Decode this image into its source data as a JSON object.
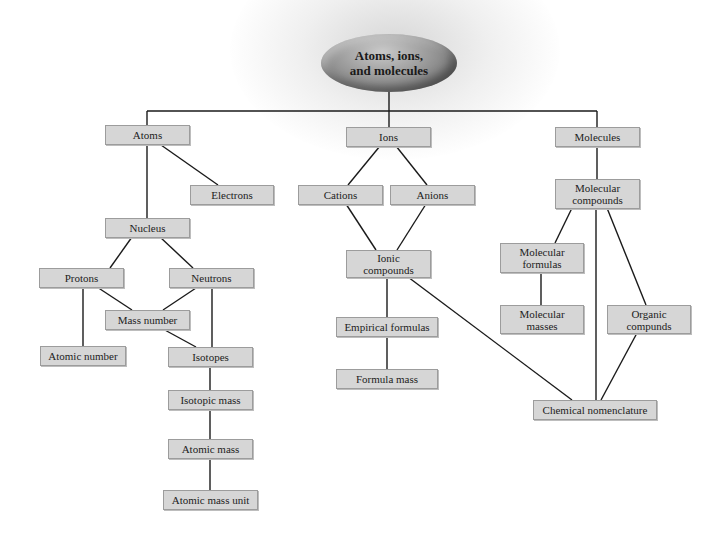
{
  "diagram": {
    "type": "concept-map",
    "root": {
      "label": "Atoms, ions,\nand molecules"
    },
    "branches": {
      "atoms": {
        "atoms": "Atoms",
        "electrons": "Electrons",
        "nucleus": "Nucleus",
        "protons": "Protons",
        "neutrons": "Neutrons",
        "mass_number": "Mass number",
        "atomic_number": "Atomic number",
        "isotopes": "Isotopes",
        "isotopic_mass": "Isotopic mass",
        "atomic_mass": "Atomic mass",
        "atomic_mass_unit": "Atomic mass unit"
      },
      "ions": {
        "ions": "Ions",
        "cations": "Cations",
        "anions": "Anions",
        "ionic_compounds": "Ionic\ncompounds",
        "empirical_formulas": "Empirical formulas",
        "formula_mass": "Formula mass"
      },
      "molecules": {
        "molecules": "Molecules",
        "molecular_compounds": "Molecular\ncompounds",
        "molecular_formulas": "Molecular\nformulas",
        "molecular_masses": "Molecular\nmasses",
        "organic_compounds": "Organic\ncompunds",
        "chemical_nomenclature": "Chemical nomenclature"
      }
    },
    "edges": [
      [
        "root",
        "atoms"
      ],
      [
        "root",
        "ions"
      ],
      [
        "root",
        "molecules"
      ],
      [
        "atoms",
        "electrons"
      ],
      [
        "atoms",
        "nucleus"
      ],
      [
        "nucleus",
        "protons"
      ],
      [
        "nucleus",
        "neutrons"
      ],
      [
        "protons",
        "atomic_number"
      ],
      [
        "protons",
        "mass_number"
      ],
      [
        "neutrons",
        "mass_number"
      ],
      [
        "neutrons",
        "isotopes"
      ],
      [
        "mass_number",
        "isotopes"
      ],
      [
        "isotopes",
        "isotopic_mass"
      ],
      [
        "isotopic_mass",
        "atomic_mass"
      ],
      [
        "atomic_mass",
        "atomic_mass_unit"
      ],
      [
        "ions",
        "cations"
      ],
      [
        "ions",
        "anions"
      ],
      [
        "cations",
        "ionic_compounds"
      ],
      [
        "anions",
        "ionic_compounds"
      ],
      [
        "ionic_compounds",
        "empirical_formulas"
      ],
      [
        "empirical_formulas",
        "formula_mass"
      ],
      [
        "ionic_compounds",
        "chemical_nomenclature"
      ],
      [
        "molecules",
        "molecular_compounds"
      ],
      [
        "molecular_compounds",
        "molecular_formulas"
      ],
      [
        "molecular_formulas",
        "molecular_masses"
      ],
      [
        "molecular_compounds",
        "organic_compounds"
      ],
      [
        "molecular_compounds",
        "chemical_nomenclature"
      ],
      [
        "organic_compounds",
        "chemical_nomenclature"
      ]
    ],
    "colors": {
      "node_fill": "#d6d6d6",
      "node_border": "#9c9c9c",
      "line": "#1a1a1a",
      "root_fill": "#8a8a8a"
    }
  }
}
